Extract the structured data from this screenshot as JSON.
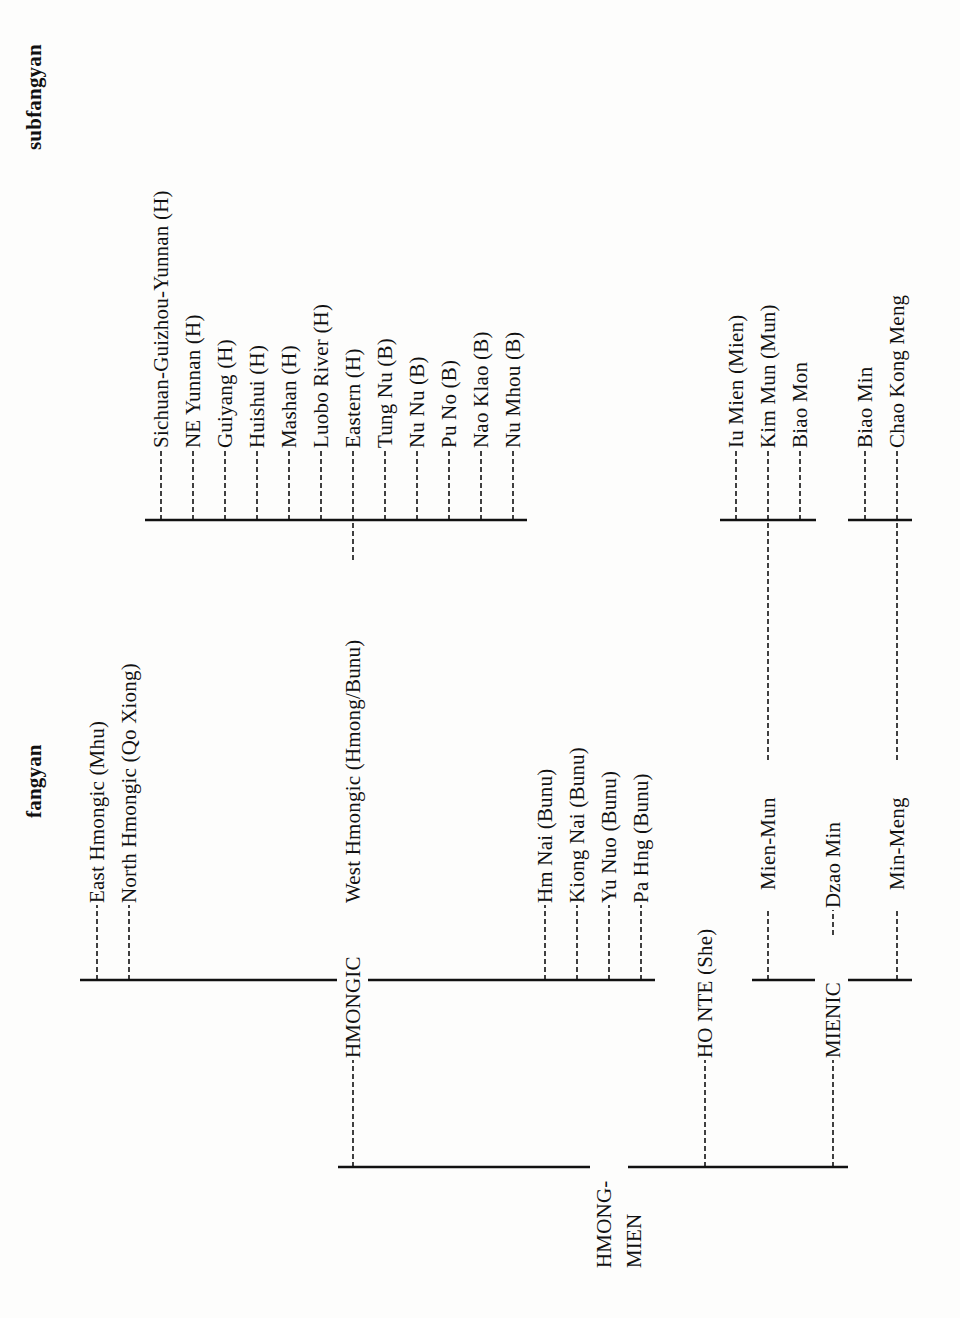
{
  "headers": {
    "fangyan": "fangyan",
    "subfangyan": "subfangyan"
  },
  "root": {
    "line1": "HMONG-",
    "line2": "MIEN"
  },
  "branches": {
    "hmongic": "HMONGIC",
    "honte": "HO NTE   (She)",
    "mienic": "MIENIC"
  },
  "fangyan": {
    "hmongic": [
      "East Hmongic (Mhu)",
      "North Hmongic (Qo Xiong)",
      "West Hmongic (Hmong/Bunu)",
      "Hm Nai (Bunu)",
      "Kiong Nai (Bunu)",
      "Yu Nuo (Bunu)",
      "Pa Hng (Bunu)"
    ],
    "mienic": [
      "Mien-Mun",
      "Dzao Min",
      "Min-Meng"
    ]
  },
  "subfangyan": {
    "west_hmongic": [
      "Sichuan-Guizhou-Yunnan (H)",
      "NE Yunnan (H)",
      "Guiyang  (H)",
      "Huishui  (H)",
      "Mashan  (H)",
      "Luobo River (H)",
      "Eastern (H)",
      "Tung Nu (B)",
      "Nu Nu (B)",
      "Pu No (B)",
      "Nao Klao  (B)",
      "Nu Mhou (B)"
    ],
    "mien_mun": [
      "Iu Mien (Mien)",
      "Kim Mun (Mun)",
      "Biao Mon"
    ],
    "min_meng": [
      "Biao Min",
      "Chao Kong Meng"
    ]
  }
}
